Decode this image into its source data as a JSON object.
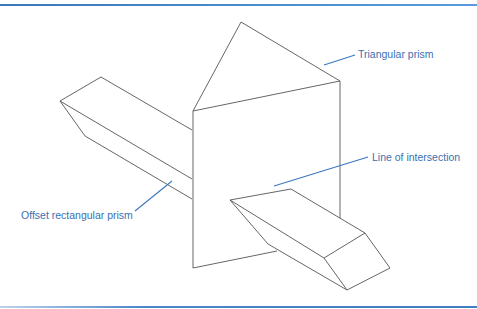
{
  "figure": {
    "type": "diagram",
    "labels": [
      {
        "id": "triangular_prism",
        "text": "Triangular prism"
      },
      {
        "id": "line_of_intersection",
        "text": "Line of intersection"
      },
      {
        "id": "offset_rectangular_prism",
        "text": "Offset rectangular prism"
      }
    ],
    "colors": {
      "line": "#555555",
      "leader": "#3a78c0",
      "label": "#3a6fb0",
      "rule": "#4a86c8"
    }
  }
}
